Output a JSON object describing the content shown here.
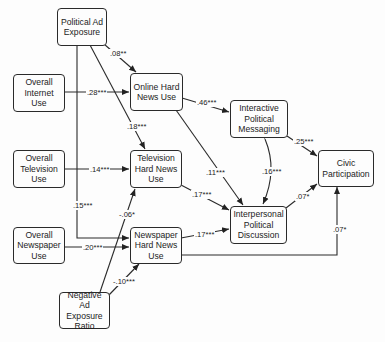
{
  "nodes": {
    "political_ad": "Political Ad Exposure",
    "overall_internet": "Overall Internet Use",
    "overall_tv": "Overall Television Use",
    "overall_newspaper": "Overall Newspaper Use",
    "negative_ad": "Negative Ad Exposure Ratio",
    "online_news": "Online Hard News Use",
    "tv_news": "Television Hard News Use",
    "newspaper_news": "Newspaper Hard News Use",
    "interactive": "Interactive Political Messaging",
    "interpersonal": "Interpersonal Political Discussion",
    "civic": "Civic Participation"
  },
  "paths": {
    "political_ad_to_online": ".08**",
    "internet_to_online": ".28***",
    "political_ad_to_tv": ".18***",
    "tv_to_tv_news": ".14***",
    "political_ad_to_newspaper": ".15***",
    "negative_to_tv_news": "-.06*",
    "newspaper_to_newspaper_news": ".20***",
    "negative_to_newspaper_news": "-.10***",
    "online_to_interactive": ".46***",
    "online_to_interpersonal": ".11***",
    "tv_news_to_interpersonal": ".17***",
    "newspaper_news_to_interpersonal": ".17***",
    "interactive_interpersonal": ".16***",
    "interactive_to_civic": ".25***",
    "interpersonal_to_civic": ".07*",
    "newspaper_news_to_civic": ".07*"
  }
}
